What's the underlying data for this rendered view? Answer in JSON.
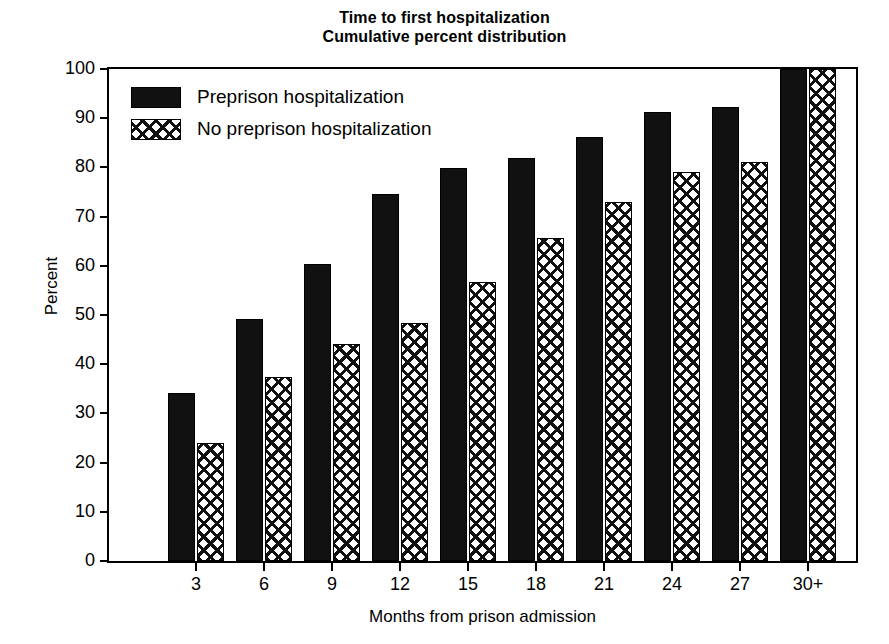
{
  "chart_data": {
    "type": "bar",
    "title": "Time to first hospitalization\nCumulative percent distribution",
    "title_lines": [
      "Time to first hospitalization",
      "Cumulative percent distribution"
    ],
    "xlabel": "Months from prison admission",
    "ylabel": "Percent",
    "ylim": [
      0,
      100
    ],
    "ytick_values": [
      0,
      10,
      20,
      30,
      40,
      50,
      60,
      70,
      80,
      90,
      100
    ],
    "ytick_labels": [
      "0",
      "10",
      "20",
      "30",
      "40",
      "50",
      "60",
      "70",
      "80",
      "90",
      "100"
    ],
    "grid": false,
    "legend_position": "upper-left-inside",
    "categories": [
      "3",
      "6",
      "9",
      "12",
      "15",
      "18",
      "21",
      "24",
      "27",
      "30+"
    ],
    "series": [
      {
        "name": "Preprison hospitalization",
        "fill": "solid-black",
        "color": "#111111",
        "values": [
          34.1,
          49.2,
          60.4,
          74.5,
          79.8,
          82.0,
          86.2,
          91.3,
          92.3,
          100.0
        ]
      },
      {
        "name": "No preprison hospitalization",
        "fill": "crosshatch",
        "color": "#111111",
        "values": [
          24.0,
          37.3,
          44.2,
          48.4,
          56.7,
          65.6,
          72.9,
          79.1,
          81.2,
          100.0
        ]
      }
    ]
  },
  "legend": {
    "items": [
      {
        "label": "Preprison hospitalization",
        "fill": "solid"
      },
      {
        "label": "No preprison hospitalization",
        "fill": "hatch"
      }
    ]
  }
}
